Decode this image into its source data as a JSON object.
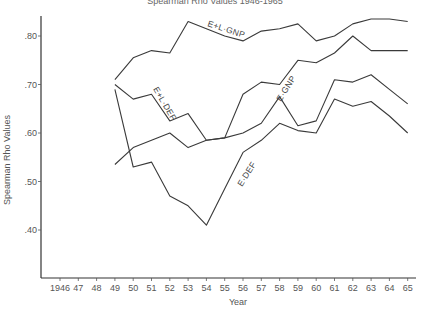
{
  "chart_data": {
    "type": "line",
    "title": "",
    "xlabel": "Year",
    "ylabel": "Spearman Rho Values",
    "x_ticks": [
      "1946",
      "47",
      "48",
      "49",
      "50",
      "51",
      "52",
      "53",
      "54",
      "55",
      "56",
      "57",
      "58",
      "59",
      "60",
      "61",
      "62",
      "63",
      "64",
      "65"
    ],
    "y_ticks": [
      ".40",
      ".50",
      ".60",
      ".70",
      ".80"
    ],
    "ylim": [
      0.32,
      0.85
    ],
    "xlim": [
      1946,
      1965
    ],
    "grid": false,
    "legend": "inline labels on lines",
    "x": [
      1949,
      1950,
      1951,
      1952,
      1953,
      1954,
      1955,
      1956,
      1957,
      1958,
      1959,
      1960,
      1961,
      1962,
      1963,
      1964,
      1965
    ],
    "series": [
      {
        "name": "E+L GNP",
        "values": [
          0.71,
          0.755,
          0.77,
          0.765,
          0.83,
          0.815,
          0.8,
          0.79,
          0.81,
          0.815,
          0.825,
          0.79,
          0.8,
          0.825,
          0.835,
          0.835,
          0.83
        ]
      },
      {
        "name": "E+L DEF",
        "values": [
          0.7,
          0.67,
          0.68,
          0.625,
          0.64,
          0.585,
          0.59,
          0.6,
          0.62,
          0.675,
          0.615,
          0.625,
          0.71,
          0.705,
          0.72,
          0.69,
          0.66
        ]
      },
      {
        "name": "E GNP",
        "values": [
          0.535,
          0.57,
          0.585,
          0.6,
          0.57,
          0.585,
          0.59,
          0.68,
          0.705,
          0.7,
          0.75,
          0.745,
          0.765,
          0.8,
          0.77,
          0.77,
          0.77
        ]
      },
      {
        "name": "E DEF",
        "values": [
          0.69,
          0.53,
          0.54,
          0.47,
          0.45,
          0.41,
          0.485,
          0.56,
          0.585,
          0.62,
          0.605,
          0.6,
          0.67,
          0.655,
          0.665,
          0.635,
          0.6
        ]
      }
    ],
    "annotations": [
      "E+L GNP",
      "E+L DEF",
      "E GNP",
      "E DEF"
    ]
  },
  "labels": {
    "title_partial": "Spearman Rho Values",
    "xlabel": "Year",
    "ylabel": "Spearman Rho Values"
  }
}
